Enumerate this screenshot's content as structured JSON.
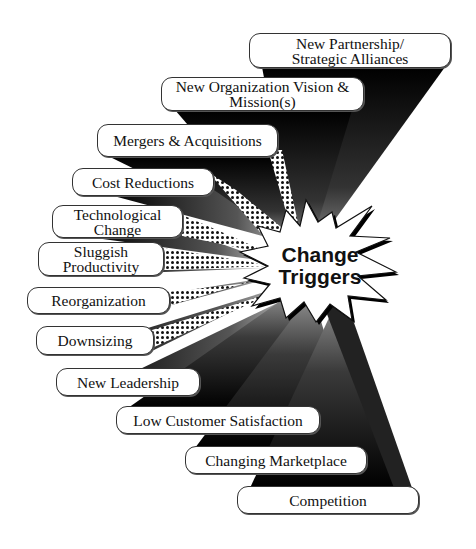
{
  "diagram": {
    "title": "Change Triggers",
    "center_label_lines": [
      "Change",
      "Triggers"
    ],
    "hub": {
      "x": 318,
      "y": 266
    },
    "colors": {
      "ray_dark": "#000000",
      "ray_light": "#b0b0b0",
      "box_fill": "#ffffff",
      "box_border": "#333333",
      "dots": "#111111"
    },
    "triggers": [
      {
        "label": "New Partnership/\nStrategic Alliances",
        "x": 249,
        "y": 33,
        "w": 202,
        "h": 35
      },
      {
        "label": "New Organization Vision &\nMission(s)",
        "x": 161,
        "y": 77,
        "w": 203,
        "h": 34
      },
      {
        "label": "Mergers & Acquisitions",
        "x": 97,
        "y": 124,
        "w": 181,
        "h": 33
      },
      {
        "label": "Cost Reductions",
        "x": 72,
        "y": 168,
        "w": 142,
        "h": 28
      },
      {
        "label": "Technological\nChange",
        "x": 52,
        "y": 205,
        "w": 131,
        "h": 33
      },
      {
        "label": "Sluggish\nProductivity",
        "x": 38,
        "y": 242,
        "w": 126,
        "h": 34
      },
      {
        "label": "Reorganization",
        "x": 27,
        "y": 287,
        "w": 143,
        "h": 27
      },
      {
        "label": "Downsizing",
        "x": 36,
        "y": 326,
        "w": 118,
        "h": 29
      },
      {
        "label": "New Leadership",
        "x": 56,
        "y": 368,
        "w": 144,
        "h": 28
      },
      {
        "label": "Low Customer Satisfaction",
        "x": 116,
        "y": 406,
        "w": 204,
        "h": 28
      },
      {
        "label": "Changing Marketplace",
        "x": 185,
        "y": 446,
        "w": 182,
        "h": 28
      },
      {
        "label": "Competition",
        "x": 237,
        "y": 486,
        "w": 182,
        "h": 28
      }
    ]
  }
}
